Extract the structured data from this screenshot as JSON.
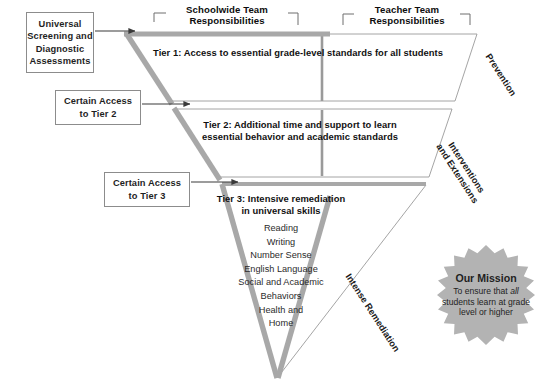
{
  "diagram": {
    "colors": {
      "triangle_stroke": "#a8a8a8",
      "thin_outline": "#909090",
      "arrow": "#3a3a3a",
      "starburst_fill": "#b3b3b3",
      "box_border": "#8c8c8c",
      "text": "#1a1a1a"
    }
  },
  "input_boxes": [
    {
      "name": "universal-screening",
      "lines": [
        "Universal",
        "Screening and",
        "Diagnostic",
        "Assessments"
      ]
    },
    {
      "name": "certain-access-tier-2",
      "lines": [
        "Certain Access",
        "to Tier 2"
      ]
    },
    {
      "name": "certain-access-tier-3",
      "lines": [
        "Certain Access",
        "to Tier 3"
      ]
    }
  ],
  "brackets": [
    {
      "name": "schoolwide-team",
      "line1": "Schoolwide Team",
      "line2": "Responsibilities"
    },
    {
      "name": "teacher-team",
      "line1": "Teacher Team",
      "line2": "Responsibilities"
    }
  ],
  "tiers": [
    {
      "id": "tier-1",
      "lines": [
        "Tier 1: Access to essential grade-level standards for all students"
      ],
      "side_label": "Prevention"
    },
    {
      "id": "tier-2",
      "lines": [
        "Tier 2: Additional time and support to learn",
        "essential behavior and academic standards"
      ],
      "side_label_line1": "Interventions",
      "side_label_line2": "and Extensions"
    },
    {
      "id": "tier-3",
      "lines": [
        "Tier 3: Intensive remediation",
        "in universal skills"
      ],
      "skills": [
        "Reading",
        "Writing",
        "Number Sense",
        "English Language",
        "Social and Academic",
        "Behaviors",
        "Health and",
        "Home"
      ],
      "side_label": "Intense Remediation"
    }
  ],
  "mission": {
    "title": "Our Mission",
    "body_before": "To ensure that ",
    "body_emphasis": "all",
    "body_after": " students learn at grade level or higher"
  }
}
